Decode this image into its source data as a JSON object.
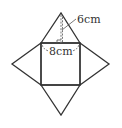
{
  "diagram": {
    "labels": {
      "slant_height": "6cm",
      "base_edge": "8cm"
    },
    "colors": {
      "stroke": "#333333",
      "dashed": "#777777",
      "background": "#ffffff"
    },
    "shapes": {
      "square": "base",
      "triangles": [
        "top-face",
        "left-face",
        "right-face",
        "bottom-face"
      ]
    }
  }
}
